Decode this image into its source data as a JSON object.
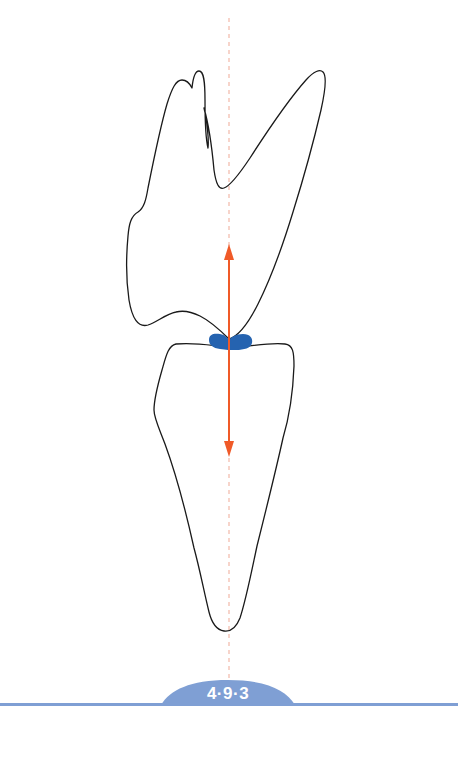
{
  "figure": {
    "label": "4·9·3",
    "elements": {
      "upper_tooth": "upper-tooth-outline",
      "lower_tooth": "lower-tooth-outline",
      "contact_point": "occlusal-contact-mark",
      "force_arrow": "vertical-force-arrow",
      "axis_line": "long-axis-dashed-line"
    },
    "colors": {
      "outline": "#1a1a1a",
      "contact": "#2563b0",
      "arrow": "#f05a28",
      "axis": "#f2b8a8",
      "label_bg": "#7f9fd4",
      "bar": "#7f9fd4",
      "label_text": "#ffffff"
    }
  }
}
